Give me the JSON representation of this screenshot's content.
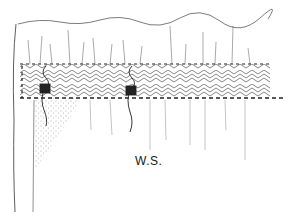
{
  "figure": {
    "type": "line-drawing",
    "colors": {
      "ink": "#1a1a1a",
      "paper": "#ffffff",
      "stipple": "#555555"
    }
  },
  "labels": {
    "ws": "W.S."
  }
}
